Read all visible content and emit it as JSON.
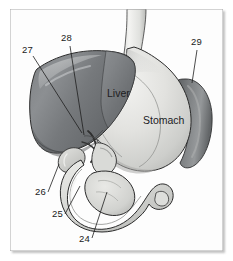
{
  "figure": {
    "background_color": "#ffffff",
    "frame_color": "#a9a9a9"
  },
  "organ_labels": [
    {
      "name": "liver",
      "text": "Liver",
      "x": 107,
      "y": 94
    },
    {
      "name": "stomach",
      "text": "Stomach",
      "x": 143,
      "y": 121
    }
  ],
  "reference_numbers": [
    {
      "name": "callout-27",
      "text": "27",
      "x": 22,
      "y": 50,
      "leader": {
        "x1": 33,
        "y1": 56,
        "x2": 82,
        "y2": 133
      }
    },
    {
      "name": "callout-28",
      "text": "28",
      "x": 61,
      "y": 36,
      "leader": {
        "x1": 70,
        "y1": 46,
        "x2": 84,
        "y2": 135
      }
    },
    {
      "name": "callout-29",
      "text": "29",
      "x": 192,
      "y": 40,
      "leader": {
        "x1": 196,
        "y1": 50,
        "x2": 192,
        "y2": 83
      }
    },
    {
      "name": "callout-26",
      "text": "26",
      "x": 36,
      "y": 192,
      "leader": {
        "x1": 48,
        "y1": 192,
        "x2": 59,
        "y2": 164
      }
    },
    {
      "name": "callout-25",
      "text": "25",
      "x": 53,
      "y": 215,
      "leader": {
        "x1": 65,
        "y1": 214,
        "x2": 80,
        "y2": 186
      }
    },
    {
      "name": "callout-24",
      "text": "24",
      "x": 80,
      "y": 239,
      "leader": {
        "x1": 92,
        "y1": 238,
        "x2": 107,
        "y2": 192
      }
    }
  ],
  "colors": {
    "liver_dark": "#6f7274",
    "liver_mid": "#83868a",
    "liver_light": "#a9acae",
    "stomach_light": "#e6e6e4",
    "stomach_mid": "#cfd0cf",
    "spleen_dark": "#6e7173",
    "duodenum": "#dcdcd9",
    "pancreas": "#d2d3d0",
    "outline": "#2b2b2b",
    "esophagus": "#ececeb"
  }
}
